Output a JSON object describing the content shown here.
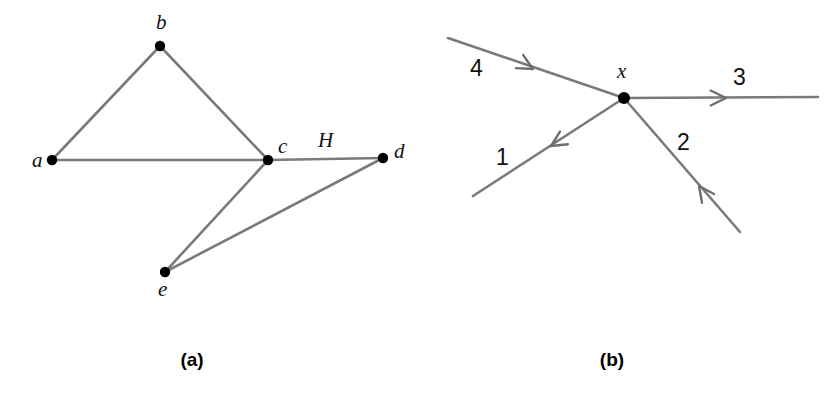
{
  "figure": {
    "background_color": "#ffffff",
    "edge_color": "#7a7a7a",
    "node_color": "#000000",
    "label_color": "#111111",
    "width": 839,
    "height": 393
  },
  "panels": [
    {
      "id": "panel-a",
      "caption": "(a)",
      "caption_x": 192,
      "caption_y": 366,
      "type": "undirected-graph",
      "vertices": [
        {
          "id": "a",
          "label": "a",
          "x": 52,
          "y": 160,
          "label_x": 32,
          "label_y": 167,
          "r": 5.2
        },
        {
          "id": "b",
          "label": "b",
          "x": 160,
          "y": 46,
          "label_x": 156,
          "label_y": 29,
          "r": 5.2
        },
        {
          "id": "c",
          "label": "c",
          "x": 268,
          "y": 160,
          "label_x": 278,
          "label_y": 153,
          "r": 5.2
        },
        {
          "id": "d",
          "label": "d",
          "x": 383,
          "y": 158,
          "label_x": 394,
          "label_y": 158,
          "r": 5.2
        },
        {
          "id": "e",
          "label": "e",
          "x": 165,
          "y": 272,
          "label_x": 158,
          "label_y": 296,
          "r": 5.2
        }
      ],
      "edges": [
        {
          "id": "edge-ab",
          "from": "a",
          "to": "b",
          "label": ""
        },
        {
          "id": "edge-bc",
          "from": "b",
          "to": "c",
          "label": ""
        },
        {
          "id": "edge-ac",
          "from": "a",
          "to": "c",
          "label": ""
        },
        {
          "id": "edge-cd",
          "from": "c",
          "to": "d",
          "label": "H",
          "label_x": 318,
          "label_y": 147
        },
        {
          "id": "edge-ce",
          "from": "c",
          "to": "e",
          "label": ""
        },
        {
          "id": "edge-ed",
          "from": "e",
          "to": "d",
          "label": ""
        }
      ]
    },
    {
      "id": "panel-b",
      "caption": "(b)",
      "caption_x": 612,
      "caption_y": 366,
      "type": "directed-incidence",
      "vertices": [
        {
          "id": "x",
          "label": "x",
          "x": 624,
          "y": 98,
          "label_x": 617,
          "label_y": 78,
          "r": 6.0
        }
      ],
      "edges": [
        {
          "id": "edge-1",
          "label": "1",
          "direction": "incoming",
          "endpoint_x": 473,
          "endpoint_y": 196,
          "label_x": 496,
          "label_y": 165,
          "arrow_x": 551,
          "arrow_y": 146,
          "arrow_angle_deg": -32
        },
        {
          "id": "edge-2",
          "label": "2",
          "direction": "outgoing",
          "endpoint_x": 740,
          "endpoint_y": 232,
          "label_x": 677,
          "label_y": 150,
          "arrow_x": 699,
          "arrow_y": 186,
          "arrow_angle_deg": 54
        },
        {
          "id": "edge-3",
          "label": "3",
          "direction": "incoming",
          "endpoint_x": 818,
          "endpoint_y": 97,
          "label_x": 733,
          "label_y": 85,
          "arrow_x": 726,
          "arrow_y": 98,
          "arrow_angle_deg": 180
        },
        {
          "id": "edge-4",
          "label": "4",
          "direction": "outgoing",
          "endpoint_x": 448,
          "endpoint_y": 38,
          "label_x": 470,
          "label_y": 76,
          "arrow_x": 533,
          "arrow_y": 69,
          "arrow_angle_deg": 209
        }
      ]
    }
  ]
}
